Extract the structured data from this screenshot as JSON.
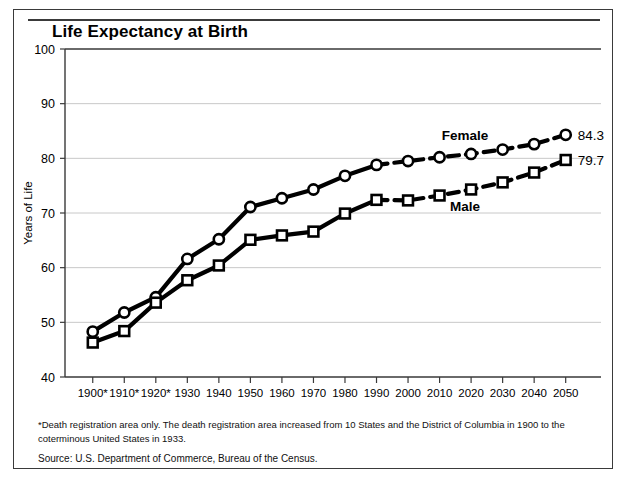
{
  "figure": {
    "title": "Life Expectancy at Birth",
    "footnote": "*Death registration area only. The death registration area increased from 10 States and the District of Columbia in 1900 to the coterminous United States in 1933.",
    "source": "Source:  U.S. Department of Commerce, Bureau of the Census."
  },
  "chart_data": {
    "type": "line",
    "title": "Life Expectancy at Birth",
    "xlabel": "",
    "ylabel": "Years of Life",
    "ylim": [
      40,
      100
    ],
    "yticks": [
      40,
      50,
      60,
      70,
      80,
      90,
      100
    ],
    "grid": true,
    "legend": "inline-annotations",
    "categories": [
      "1900*",
      "1910*",
      "1920*",
      "1930",
      "1940",
      "1950",
      "1960",
      "1970",
      "1980",
      "1990",
      "2000",
      "2010",
      "2020",
      "2030",
      "2040",
      "2050"
    ],
    "x": [
      1900,
      1910,
      1920,
      1930,
      1940,
      1950,
      1960,
      1970,
      1980,
      1990,
      2000,
      2010,
      2020,
      2030,
      2040,
      2050
    ],
    "projection_starts_at": 1990,
    "series": [
      {
        "name": "Female",
        "marker": "circle",
        "values": [
          48.3,
          51.8,
          54.6,
          61.6,
          65.2,
          71.1,
          72.7,
          74.3,
          76.8,
          78.8,
          79.5,
          80.2,
          80.8,
          81.6,
          82.6,
          84.3
        ],
        "end_label": "84.3"
      },
      {
        "name": "Male",
        "marker": "square",
        "values": [
          46.3,
          48.4,
          53.6,
          57.7,
          60.4,
          65.1,
          65.9,
          66.6,
          69.9,
          72.4,
          72.3,
          73.2,
          74.3,
          75.6,
          77.4,
          79.7
        ],
        "end_label": "79.7"
      }
    ]
  },
  "axis": {
    "y_label": "Years of Life"
  },
  "colors": {
    "line": "#000000",
    "grid": "#c8c8c8",
    "frame": "#3a3a3a",
    "background": "#ffffff"
  }
}
